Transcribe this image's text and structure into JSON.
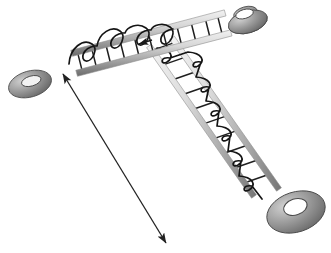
{
  "figure": {
    "background_color": "#ffffff",
    "width": 331,
    "height": 253
  },
  "colors": {
    "line_dark": "#1a1a1a",
    "rail_light": "#d8d8d8",
    "rail_mid": "#9a9a9a",
    "rail_shadow": "#6e6e6e",
    "dome_light": "#bdbdbd",
    "dome_mid": "#8c8c8c",
    "dome_dark": "#5f5f5f",
    "dome_outline": "#4a4a4a",
    "dome_opening": "#ffffff",
    "arrow": "#222222",
    "background": "#ffffff"
  },
  "elements": {
    "horizontal_ladder": {
      "name": "horizontal-ladder",
      "rail_upper": {
        "x1": 71,
        "y1": 53,
        "x2": 224,
        "y2": 13
      },
      "rail_lower": {
        "x1": 76,
        "y1": 73,
        "x2": 231,
        "y2": 33
      },
      "rung_count": 11,
      "rung_spacing": 14.2,
      "orientation": "upper-right"
    },
    "vertical_ladder": {
      "name": "vertical-ladder",
      "rail_left": {
        "x1": 149,
        "y1": 46,
        "x2": 252,
        "y2": 193
      },
      "rail_right": {
        "x1": 172,
        "y1": 38,
        "x2": 277,
        "y2": 186
      },
      "rung_count": 10,
      "rung_spacing": 15.4,
      "orientation": "lower-right"
    },
    "coil_wave_horizontal": {
      "name": "coil-wave-horizontal",
      "loop_count": 5,
      "description": "Rounded loop coil winding across the left portion of the horizontal ladder",
      "start": {
        "x": 70,
        "y": 62
      },
      "end": {
        "x": 160,
        "y": 39
      }
    },
    "zigzag_wave_vertical": {
      "name": "zigzag-wave-vertical",
      "segment_count": 9,
      "description": "Square-wave zigzag winding running down the vertical ladder",
      "start": {
        "x": 156,
        "y": 52
      },
      "end": {
        "x": 268,
        "y": 196
      }
    },
    "measure_arrow": {
      "name": "double-headed-measure-arrow",
      "from": {
        "x": 62,
        "y": 73
      },
      "to": {
        "x": 167,
        "y": 244
      },
      "heads": "both",
      "style": "thin-solid"
    },
    "small_arrow": {
      "name": "small-pointer-arrow",
      "from": {
        "x": 152,
        "y": 41
      },
      "to": {
        "x": 137,
        "y": 44
      },
      "heads": "end",
      "style": "thin-solid"
    }
  },
  "domes": [
    {
      "name": "dome-top-right",
      "cx": 247,
      "cy": 19,
      "rx": 20,
      "ry": 11,
      "opening_rx": 9,
      "opening_ry": 4.5,
      "size": "small"
    },
    {
      "name": "dome-left",
      "cx": 30,
      "cy": 84,
      "rx": 22,
      "ry": 13,
      "opening_rx": 10,
      "opening_ry": 5,
      "size": "small"
    },
    {
      "name": "dome-bottom-right",
      "cx": 296,
      "cy": 212,
      "rx": 30,
      "ry": 20,
      "opening_rx": 12,
      "opening_ry": 8,
      "size": "large"
    }
  ],
  "labels": {
    "alt_text": "Technical line drawing: an L-shaped ladder-like lattice drawn in perspective with coiled and zigzag wave lines threaded through its rungs, three shaded dome shapes positioned around it, and a long double-headed arrow measuring a diagonal distance."
  }
}
